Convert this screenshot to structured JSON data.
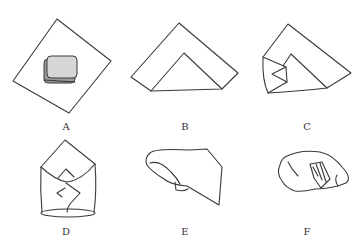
{
  "diagram": {
    "type": "step-by-step folding illustration",
    "panels": [
      {
        "id": "A",
        "label": "A",
        "description": "Square cloth laid as a diamond with a rectangular item placed at center"
      },
      {
        "id": "B",
        "label": "B",
        "description": "Cloth folded in half into a triangle with inner triangular fold"
      },
      {
        "id": "C",
        "label": "C",
        "description": "Left corner folded in over the item"
      },
      {
        "id": "D",
        "label": "D",
        "description": "Both side corners folded in forming an envelope shape"
      },
      {
        "id": "E",
        "label": "E",
        "description": "Bundle rolled and wrapped into a cylindrical shape"
      },
      {
        "id": "F",
        "label": "F",
        "description": "Finished wrapped bundle with hatched tuck section"
      }
    ]
  },
  "colors": {
    "line": "#3a3a3a",
    "item_fill": "#cfcfcf",
    "background": "#ffffff"
  }
}
